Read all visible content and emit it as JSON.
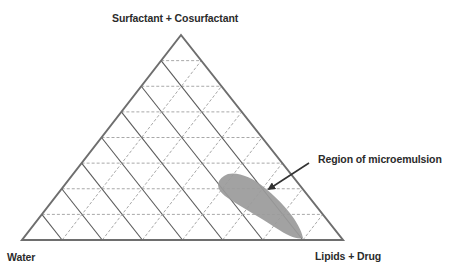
{
  "diagram": {
    "type": "ternary_phase_diagram",
    "vertices": {
      "top": "Surfactant + Cosurfactant",
      "bottom_left": "Water",
      "bottom_right": "Lipids + Drug"
    },
    "grid_divisions": 8,
    "annotation": {
      "label": "Region of microemulsion",
      "arrow": true
    },
    "region": {
      "name": "microemulsion",
      "fill_color": "#9a9a9a",
      "location": "near Lipids + Drug vertex, along the lipid-surfactant edge"
    },
    "colors": {
      "outline": "#6e6e6e",
      "solid_grid": "#5a5a5a",
      "dashed_grid": "#a8a8a8",
      "text": "#2b2b2b",
      "arrow": "#333333"
    }
  }
}
